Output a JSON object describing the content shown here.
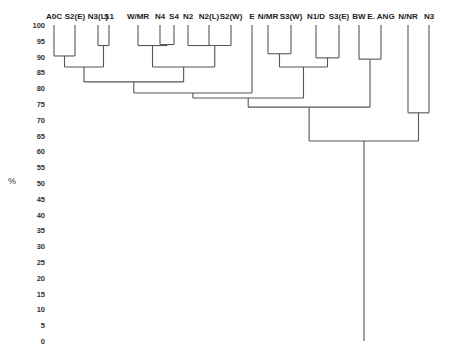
{
  "chart_data": {
    "type": "dendrogram",
    "title": "",
    "xlabel": "",
    "ylabel": "%",
    "ylim": [
      0,
      100
    ],
    "y_ticks": [
      100,
      95,
      90,
      85,
      80,
      75,
      70,
      65,
      60,
      55,
      50,
      45,
      40,
      35,
      30,
      25,
      20,
      15,
      10,
      5,
      0
    ],
    "grid": false,
    "leaves": [
      "A0C",
      "S2(E)",
      "N3(L)",
      "S1",
      "W/MR",
      "N4",
      "S4",
      "N2",
      "N2(L)",
      "S2(W)",
      "E",
      "N/MR",
      "S3(W)",
      "N1/D",
      "S3(E)",
      "BW",
      "E. ANG",
      "N/NR",
      "N3"
    ],
    "merges": [
      {
        "id": "c1",
        "children": [
          "N4",
          "S4"
        ],
        "similarity": 93.8
      },
      {
        "id": "c2",
        "children": [
          "W/MR",
          "c1"
        ],
        "similarity": 93.5
      },
      {
        "id": "c3",
        "children": [
          "N2",
          "N2(L)"
        ],
        "similarity": 93.5
      },
      {
        "id": "c4",
        "children": [
          "c3",
          "S2(W)"
        ],
        "similarity": 93.5
      },
      {
        "id": "c5",
        "children": [
          "N3(L)",
          "S1"
        ],
        "similarity": 93.5
      },
      {
        "id": "c6",
        "children": [
          "N/MR",
          "S3(W)"
        ],
        "similarity": 90.9
      },
      {
        "id": "c7",
        "children": [
          "A0C",
          "S2(E)"
        ],
        "similarity": 90.2
      },
      {
        "id": "c8",
        "children": [
          "N1/D",
          "S3(E)"
        ],
        "similarity": 89.6
      },
      {
        "id": "c9",
        "children": [
          "BW",
          "E. ANG"
        ],
        "similarity": 89.2
      },
      {
        "id": "c10",
        "children": [
          "c7",
          "c5"
        ],
        "similarity": 86.7
      },
      {
        "id": "c11",
        "children": [
          "c2",
          "c4"
        ],
        "similarity": 86.7
      },
      {
        "id": "c12",
        "children": [
          "c6",
          "c8"
        ],
        "similarity": 86.7
      },
      {
        "id": "c13",
        "children": [
          "c10",
          "c11"
        ],
        "similarity": 82.0
      },
      {
        "id": "c14",
        "children": [
          "c13",
          "E"
        ],
        "similarity": 78.5
      },
      {
        "id": "c15",
        "children": [
          "c14",
          "c12"
        ],
        "similarity": 76.9
      },
      {
        "id": "c16",
        "children": [
          "c15",
          "c9"
        ],
        "similarity": 74.0
      },
      {
        "id": "c17",
        "children": [
          "N/NR",
          "N3"
        ],
        "similarity": 72.2
      },
      {
        "id": "c18",
        "children": [
          "c16",
          "c17"
        ],
        "similarity": 63.3
      }
    ],
    "root_extends_to": 0
  },
  "layout": {
    "line_color": "#555555",
    "leaf_x": {
      "A0C": 54,
      "S2(E)": 75,
      "N3(L)": 98,
      "S1": 109,
      "W/MR": 138,
      "N4": 160,
      "S4": 174,
      "N2": 188,
      "N2(L)": 209,
      "S2(W)": 231,
      "E": 252,
      "N/MR": 268,
      "S3(W)": 291,
      "N1/D": 316,
      "S3(E)": 339,
      "BW": 359,
      "E. ANG": 381,
      "N/NR": 408,
      "N3": 429
    },
    "y_axis": {
      "y_at_100": 25,
      "y_at_0": 341,
      "label_x": 45
    }
  }
}
